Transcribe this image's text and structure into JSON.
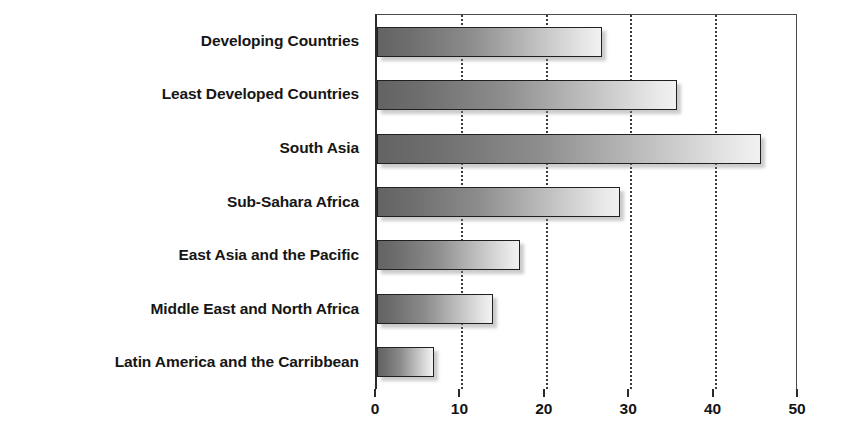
{
  "chart_data": {
    "type": "bar",
    "orientation": "horizontal",
    "title": "",
    "subtitle": "",
    "xlabel": "",
    "ylabel": "",
    "categories": [
      "Developing Countries",
      "Least Developed Countries",
      "South Asia",
      "Sub-Sahara Africa",
      "East Asia and the Pacific",
      "Middle East and North Africa",
      "Latin America and the Carribbean"
    ],
    "values": [
      26.6,
      35.5,
      45.5,
      28.8,
      17.0,
      13.8,
      6.8
    ],
    "xlim": [
      0,
      50
    ],
    "xticks": [
      0,
      10,
      20,
      30,
      40,
      50
    ],
    "xtick_labels": [
      "0",
      "10",
      "20",
      "30",
      "40",
      "50"
    ],
    "grid": "vertical-dotted",
    "legend": "none",
    "bar_gradient_start": "#636363",
    "bar_gradient_end": "#f1f1f1",
    "bar_border_color": "#202020",
    "axis_color": "#2b2b2b",
    "text_color": "#141414",
    "background": "#ffffff"
  }
}
